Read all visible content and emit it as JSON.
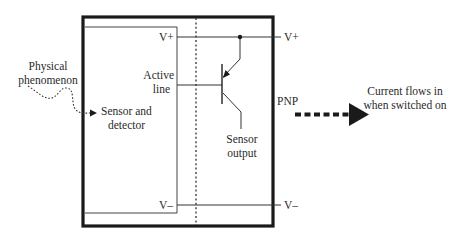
{
  "diagram": {
    "type": "PNP sensor output circuit",
    "labels": {
      "physical_phenomenon_line1": "Physical",
      "physical_phenomenon_line2": "phenomenon",
      "sensor_detector_line1": "Sensor and",
      "sensor_detector_line2": "detector",
      "active_line_line1": "Active",
      "active_line_line2": "line",
      "vplus_inner": "V+",
      "vplus_outer": "V+",
      "vminus_inner": "V–",
      "vminus_outer": "V–",
      "sensor_output_line1": "Sensor",
      "sensor_output_line2": "output",
      "pnp": "PNP",
      "current_line1": "Current flows in",
      "current_line2": "when switched on"
    },
    "colors": {
      "line": "#2b2b2b",
      "thick_border": "#1a1a1a",
      "background": "#ffffff"
    }
  }
}
